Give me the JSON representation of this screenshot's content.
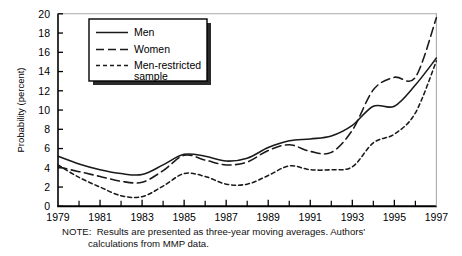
{
  "figure": {
    "caption_note_label": "NOTE:",
    "note_line_1": "NOTE:  Results are presented as three-year moving averages. Authors'",
    "note_line_2": "calculations from MMP data."
  },
  "legend": {
    "position": "top-left-inside",
    "entries": [
      {
        "label": "Men",
        "style": "solid",
        "key": "men"
      },
      {
        "label": "Women",
        "style": "dashed",
        "key": "women"
      },
      {
        "label": "Men-restricted sample",
        "label_line_1": "Men-restricted",
        "label_line_2": "sample",
        "style": "dotted",
        "key": "men_restricted"
      }
    ]
  },
  "chart_data": {
    "type": "line",
    "title": "",
    "xlabel": "",
    "ylabel": "Probability (percent)",
    "xlim": [
      1979,
      1997
    ],
    "ylim": [
      0,
      20
    ],
    "grid": false,
    "x": [
      1979,
      1980,
      1981,
      1982,
      1983,
      1984,
      1985,
      1986,
      1987,
      1988,
      1989,
      1990,
      1991,
      1992,
      1993,
      1994,
      1995,
      1996,
      1997
    ],
    "xticks_major": [
      1979,
      1981,
      1983,
      1985,
      1987,
      1989,
      1991,
      1993,
      1995,
      1997
    ],
    "xticks_minor": [
      1980,
      1982,
      1984,
      1986,
      1988,
      1990,
      1992,
      1994,
      1996
    ],
    "xtick_labels": [
      "1979",
      "1981",
      "1983",
      "1985",
      "1987",
      "1989",
      "1991",
      "1993",
      "1995",
      "1997"
    ],
    "yticks": [
      0,
      2,
      4,
      6,
      8,
      10,
      12,
      14,
      16,
      18,
      20
    ],
    "ytick_labels": [
      "0",
      "2",
      "4",
      "6",
      "8",
      "10",
      "12",
      "14",
      "16",
      "18",
      "20"
    ],
    "series": [
      {
        "name": "Men",
        "style": "solid",
        "values": [
          5.2,
          4.4,
          3.8,
          3.4,
          3.3,
          4.3,
          5.4,
          5.2,
          4.7,
          5.0,
          6.1,
          6.8,
          7.0,
          7.3,
          8.4,
          10.4,
          10.4,
          12.6,
          15.4
        ]
      },
      {
        "name": "Women",
        "style": "dashed",
        "values": [
          4.1,
          3.6,
          3.1,
          2.6,
          2.5,
          3.7,
          5.3,
          4.8,
          4.3,
          4.6,
          5.8,
          6.4,
          5.7,
          5.6,
          7.9,
          12.1,
          13.4,
          13.4,
          19.6
        ]
      },
      {
        "name": "Men-restricted sample",
        "style": "dotted",
        "values": [
          4.3,
          3.0,
          2.0,
          1.1,
          1.0,
          2.1,
          3.4,
          3.1,
          2.3,
          2.3,
          3.2,
          4.2,
          3.8,
          3.8,
          4.1,
          6.6,
          7.5,
          9.7,
          15.1
        ]
      }
    ]
  },
  "colors": {
    "line": "#1a1a1a",
    "axis": "#000000",
    "background": "#ffffff",
    "legend_shadow": "#2a2a2a"
  }
}
